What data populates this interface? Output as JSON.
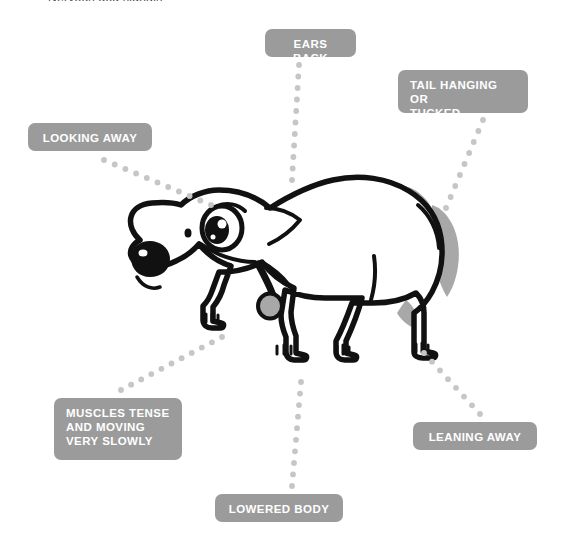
{
  "figure": {
    "subject": "dog",
    "clipped_top_text": "Nervous dog signals",
    "colors": {
      "callout_background": "#9b9b9b",
      "callout_text": "#ffffff",
      "connector_dot": "#c6c6c6",
      "outline": "#111111",
      "fill": "#ffffff",
      "shading": "#a8a8a8",
      "page_background": "#ffffff"
    }
  },
  "callouts": [
    {
      "id": "ears-back",
      "label": "EARS BACK",
      "x": 265,
      "y": 29,
      "width": 91,
      "height": 28,
      "align": "center"
    },
    {
      "id": "tail-hanging-or-tucked",
      "label": "TAIL HANGING OR\nTUCKED",
      "x": 398,
      "y": 70,
      "width": 130,
      "height": 43,
      "align": "left"
    },
    {
      "id": "looking-away",
      "label": "LOOKING AWAY",
      "x": 28,
      "y": 123,
      "width": 124,
      "height": 28,
      "align": "center"
    },
    {
      "id": "muscles-tense-and-moving-very-slowly",
      "label": "MUSCLES TENSE\nAND MOVING\nVERY SLOWLY",
      "x": 54,
      "y": 398,
      "width": 128,
      "height": 62,
      "align": "left"
    },
    {
      "id": "leaning-away",
      "label": "LEANING AWAY",
      "x": 413,
      "y": 422,
      "width": 124,
      "height": 28,
      "align": "center"
    },
    {
      "id": "lowered-body",
      "label": "LOWERED BODY",
      "x": 215,
      "y": 494,
      "width": 128,
      "height": 28,
      "align": "center"
    }
  ],
  "connectors": [
    {
      "id": "connector-ears-back",
      "from": "ears-back",
      "dots": 11,
      "x1": 299,
      "y1": 65,
      "x2": 292,
      "y2": 180
    },
    {
      "id": "connector-tail-hanging",
      "from": "tail-hanging-or-tucked",
      "dots": 9,
      "x1": 483,
      "y1": 120,
      "x2": 446,
      "y2": 208
    },
    {
      "id": "connector-looking-away",
      "from": "looking-away",
      "dots": 11,
      "x1": 104,
      "y1": 160,
      "x2": 211,
      "y2": 205
    },
    {
      "id": "connector-muscles-tense",
      "from": "muscles-tense-and-moving-very-slowly",
      "dots": 11,
      "x1": 121,
      "y1": 390,
      "x2": 222,
      "y2": 337
    },
    {
      "id": "connector-leaning-away",
      "from": "leaning-away",
      "dots": 8,
      "x1": 480,
      "y1": 414,
      "x2": 424,
      "y2": 353
    },
    {
      "id": "connector-lowered-body",
      "from": "lowered-body",
      "dots": 10,
      "x1": 292,
      "y1": 486,
      "x2": 301,
      "y2": 382
    }
  ]
}
